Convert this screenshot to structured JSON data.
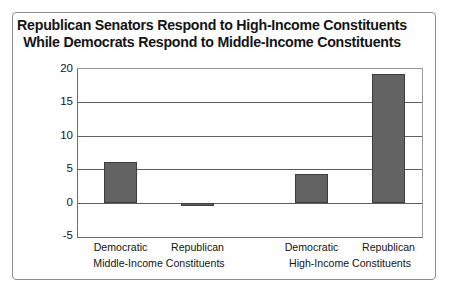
{
  "chart_data": {
    "type": "bar",
    "title": "Republican Senators Respond to High-Income Constituents While Democrats Respond to Middle-Income Constituents",
    "title_lines": [
      "Republican Senators Respond to High-Income Constituents",
      "While Democrats Respond to Middle-Income Constituents"
    ],
    "xlabel": "",
    "ylabel": "Statistical estimate of responsiveness (more —↑)",
    "ylabel_lines": [
      "Statistical estimate of",
      "responsiveness (more —↑)"
    ],
    "ylim": [
      -5,
      20
    ],
    "yticks": [
      -5,
      0,
      5,
      10,
      15,
      20
    ],
    "ytick_labels": [
      "-5",
      "0",
      "5",
      "10",
      "15",
      "20"
    ],
    "grid": true,
    "legend": "none",
    "categories": [
      "Democratic",
      "Republican",
      "Democratic",
      "Republican"
    ],
    "groups": [
      {
        "label": "Middle-Income Constituents",
        "categories": [
          "Democratic",
          "Republican"
        ],
        "values": [
          6.1,
          -0.3
        ]
      },
      {
        "label": "High-Income Constituents",
        "categories": [
          "Democratic",
          "Republican"
        ],
        "values": [
          4.3,
          19.2
        ]
      }
    ],
    "values": [
      6.1,
      -0.3,
      4.3,
      19.2
    ],
    "bar_color": "#636363",
    "bar_edge_color": "#3d3d3d",
    "axis_color": "#5f5f5f",
    "frame_color": "#8e8e8e"
  }
}
